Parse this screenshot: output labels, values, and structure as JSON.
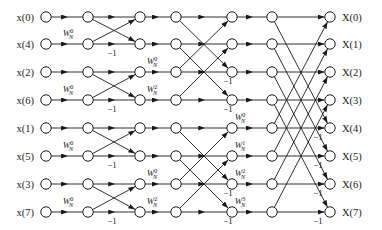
{
  "figure": {
    "type": "butterfly-diagram",
    "n_points": 8,
    "n_stages": 3,
    "node_columns": 7,
    "colors": {
      "background": "#ffffff",
      "line": "#1a1a1a",
      "node_fill": "#ffffff",
      "text": "#1a1a1a"
    }
  },
  "inputs": [
    {
      "label": "x(0)",
      "index": 0,
      "row": 0
    },
    {
      "label": "x(4)",
      "index": 4,
      "row": 1
    },
    {
      "label": "x(2)",
      "index": 2,
      "row": 2
    },
    {
      "label": "x(6)",
      "index": 6,
      "row": 3
    },
    {
      "label": "x(1)",
      "index": 1,
      "row": 4
    },
    {
      "label": "x(5)",
      "index": 5,
      "row": 5
    },
    {
      "label": "x(3)",
      "index": 3,
      "row": 6
    },
    {
      "label": "x(7)",
      "index": 7,
      "row": 7
    }
  ],
  "outputs": [
    {
      "label": "X(0)",
      "index": 0,
      "row": 0
    },
    {
      "label": "X(1)",
      "index": 1,
      "row": 1
    },
    {
      "label": "X(2)",
      "index": 2,
      "row": 2
    },
    {
      "label": "X(3)",
      "index": 3,
      "row": 3
    },
    {
      "label": "X(4)",
      "index": 4,
      "row": 4
    },
    {
      "label": "X(5)",
      "index": 5,
      "row": 5
    },
    {
      "label": "X(6)",
      "index": 6,
      "row": 6
    },
    {
      "label": "X(7)",
      "index": 7,
      "row": 7
    }
  ],
  "twiddle_factors": [
    {
      "id": "tw-s1-r1",
      "base": "W",
      "sub": "N",
      "sup": "0",
      "stage": 1,
      "row": 1,
      "x": 68,
      "y": 36
    },
    {
      "id": "tw-s1-r3",
      "base": "W",
      "sub": "N",
      "sup": "0",
      "stage": 1,
      "row": 3,
      "x": 68,
      "y": 92
    },
    {
      "id": "tw-s1-r5",
      "base": "W",
      "sub": "N",
      "sup": "0",
      "stage": 1,
      "row": 5,
      "x": 68,
      "y": 148
    },
    {
      "id": "tw-s1-r7",
      "base": "W",
      "sub": "N",
      "sup": "0",
      "stage": 1,
      "row": 7,
      "x": 68,
      "y": 204
    },
    {
      "id": "tw-s2-r2",
      "base": "W",
      "sub": "N",
      "sup": "0",
      "stage": 2,
      "row": 2,
      "x": 152,
      "y": 64
    },
    {
      "id": "tw-s2-r3",
      "base": "W",
      "sub": "N",
      "sup": "2",
      "stage": 2,
      "row": 3,
      "x": 152,
      "y": 92
    },
    {
      "id": "tw-s2-r6",
      "base": "W",
      "sub": "N",
      "sup": "0",
      "stage": 2,
      "row": 6,
      "x": 152,
      "y": 176
    },
    {
      "id": "tw-s2-r7",
      "base": "W",
      "sub": "N",
      "sup": "2",
      "stage": 2,
      "row": 7,
      "x": 152,
      "y": 204
    },
    {
      "id": "tw-s3-r4",
      "base": "W",
      "sub": "N",
      "sup": "0",
      "stage": 3,
      "row": 4,
      "x": 240,
      "y": 120
    },
    {
      "id": "tw-s3-r5",
      "base": "W",
      "sub": "N",
      "sup": "1",
      "stage": 3,
      "row": 5,
      "x": 240,
      "y": 148
    },
    {
      "id": "tw-s3-r6",
      "base": "W",
      "sub": "N",
      "sup": "2",
      "stage": 3,
      "row": 6,
      "x": 240,
      "y": 176
    },
    {
      "id": "tw-s3-r7",
      "base": "W",
      "sub": "N",
      "sup": "3",
      "stage": 3,
      "row": 7,
      "x": 240,
      "y": 204
    }
  ],
  "minus_one_labels": [
    {
      "text": "−1",
      "stage": 1,
      "row": 1,
      "x": 112,
      "y": 56
    },
    {
      "text": "−1",
      "stage": 1,
      "row": 3,
      "x": 112,
      "y": 112
    },
    {
      "text": "−1",
      "stage": 1,
      "row": 5,
      "x": 112,
      "y": 168
    },
    {
      "text": "−1",
      "stage": 1,
      "row": 7,
      "x": 112,
      "y": 224
    },
    {
      "text": "−1",
      "stage": 2,
      "row": 2,
      "x": 228,
      "y": 84
    },
    {
      "text": "−1",
      "stage": 2,
      "row": 3,
      "x": 228,
      "y": 112
    },
    {
      "text": "−1",
      "stage": 2,
      "row": 6,
      "x": 228,
      "y": 196
    },
    {
      "text": "−1",
      "stage": 2,
      "row": 7,
      "x": 228,
      "y": 224
    },
    {
      "text": "−1",
      "stage": 3,
      "row": 4,
      "x": 318,
      "y": 140
    },
    {
      "text": "−1",
      "stage": 3,
      "row": 5,
      "x": 318,
      "y": 168
    },
    {
      "text": "−1",
      "stage": 3,
      "row": 6,
      "x": 318,
      "y": 196
    },
    {
      "text": "−1",
      "stage": 3,
      "row": 7,
      "x": 318,
      "y": 224
    }
  ],
  "geometry": {
    "column_x": [
      46,
      88,
      140,
      176,
      232,
      272,
      330
    ],
    "row_y": [
      17,
      44,
      72,
      100,
      128,
      156,
      184,
      212
    ],
    "node_radius": 5.2,
    "input_label_x": 34,
    "output_label_x": 342
  },
  "chart_data": {
    "type": "diagram",
    "stages": [
      {
        "stage": 1,
        "span": 1,
        "butterfly_pairs": [
          [
            0,
            1
          ],
          [
            2,
            3
          ],
          [
            4,
            5
          ],
          [
            6,
            7
          ]
        ],
        "twiddles": [
          "W_N^0",
          "W_N^0",
          "W_N^0",
          "W_N^0"
        ]
      },
      {
        "stage": 2,
        "span": 2,
        "butterfly_pairs": [
          [
            0,
            2
          ],
          [
            1,
            3
          ],
          [
            4,
            6
          ],
          [
            5,
            7
          ]
        ],
        "twiddles": [
          "W_N^0",
          "W_N^2",
          "W_N^0",
          "W_N^2"
        ]
      },
      {
        "stage": 3,
        "span": 4,
        "butterfly_pairs": [
          [
            0,
            4
          ],
          [
            1,
            5
          ],
          [
            2,
            6
          ],
          [
            3,
            7
          ]
        ],
        "twiddles": [
          "W_N^0",
          "W_N^1",
          "W_N^2",
          "W_N^3"
        ]
      }
    ]
  }
}
